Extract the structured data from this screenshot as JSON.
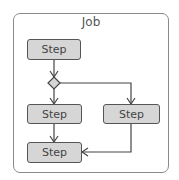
{
  "job": {
    "title": "Job"
  },
  "steps": [
    {
      "label": "Step"
    },
    {
      "label": "Step"
    },
    {
      "label": "Step"
    },
    {
      "label": "Step"
    }
  ],
  "colors": {
    "step_fill": "#d6d6d6",
    "step_border": "#555555",
    "job_border": "#8a8a8a",
    "decision_fill": "#d6d6d6"
  }
}
